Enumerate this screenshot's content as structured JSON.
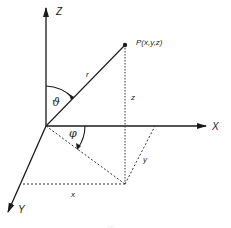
{
  "diagram": {
    "type": "spherical-coordinates",
    "colors": {
      "line": "#1a1a1a",
      "background": "#ffffff",
      "text": "#222222"
    },
    "axes": {
      "z": {
        "label": "Z"
      },
      "x": {
        "label": "X"
      },
      "y": {
        "label": "Y"
      }
    },
    "point": {
      "label": "P(x,y,z)"
    },
    "segments": {
      "radius": "r",
      "height": "z",
      "y_projection": "y",
      "x_projection": "x"
    },
    "angles": {
      "polar": "ϑ",
      "azimuth": "φ"
    },
    "caption": ". .."
  }
}
